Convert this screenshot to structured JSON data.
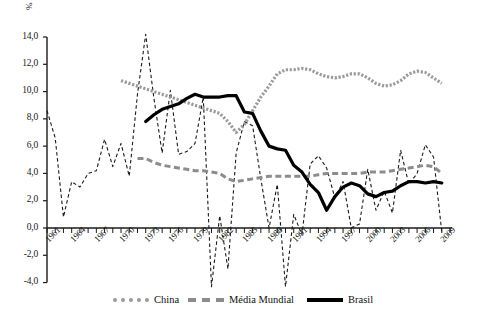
{
  "chart_data": {
    "type": "line",
    "title": "",
    "xlabel": "",
    "ylabel": "%",
    "ylim": [
      -4.0,
      14.0
    ],
    "ytick_labels": [
      "14,0",
      "12,0",
      "10,0",
      "8,0",
      "6,0",
      "4,0",
      "2,0",
      "0,0",
      "-2,0",
      "-4,0"
    ],
    "ytick_values": [
      14.0,
      12.0,
      10.0,
      8.0,
      6.0,
      4.0,
      2.0,
      0.0,
      -2.0,
      -4.0
    ],
    "xlim": [
      1961,
      2010
    ],
    "xtick_labels": [
      "1961",
      "1964",
      "1967",
      "1970",
      "1973",
      "1976",
      "1979",
      "1982",
      "1985",
      "1988",
      "1991",
      "1994",
      "1997",
      "2000",
      "2003",
      "2006",
      "2009"
    ],
    "xtick_values": [
      1961,
      1964,
      1967,
      1970,
      1973,
      1976,
      1979,
      1982,
      1985,
      1988,
      1991,
      1994,
      1997,
      2000,
      2003,
      2006,
      2009
    ],
    "grid": false,
    "legend_position": "bottom",
    "series": [
      {
        "name": "Brasil (anual)",
        "in_legend": false,
        "style": "thin-dashed",
        "color": "#1a1a1a",
        "x": [
          1961,
          1962,
          1963,
          1964,
          1965,
          1966,
          1967,
          1968,
          1969,
          1970,
          1971,
          1972,
          1973,
          1974,
          1975,
          1976,
          1977,
          1978,
          1979,
          1980,
          1981,
          1982,
          1983,
          1984,
          1985,
          1986,
          1987,
          1988,
          1989,
          1990,
          1991,
          1992,
          1993,
          1994,
          1995,
          1996,
          1997,
          1998,
          1999,
          2000,
          2001,
          2002,
          2003,
          2004,
          2005,
          2006,
          2007,
          2008,
          2009
        ],
        "y": [
          8.6,
          6.6,
          0.8,
          3.4,
          3.0,
          4.0,
          4.2,
          6.5,
          4.5,
          6.2,
          3.8,
          9.8,
          14.2,
          9.5,
          5.5,
          10.1,
          5.4,
          5.6,
          6.2,
          9.6,
          -4.3,
          0.9,
          -3.0,
          5.5,
          7.8,
          7.5,
          3.6,
          0.0,
          3.2,
          -4.3,
          1.0,
          -0.5,
          4.7,
          5.3,
          4.4,
          2.2,
          3.4,
          0.0,
          0.3,
          4.3,
          1.3,
          2.7,
          1.1,
          5.7,
          3.2,
          4.0,
          6.1,
          5.2,
          -0.3
        ]
      },
      {
        "name": "China",
        "in_legend": true,
        "style": "thick-dotted",
        "color": "#9a9a9a",
        "x": [
          1970,
          1971,
          1972,
          1973,
          1974,
          1975,
          1976,
          1977,
          1978,
          1979,
          1980,
          1981,
          1982,
          1983,
          1984,
          1985,
          1986,
          1987,
          1988,
          1989,
          1990,
          1991,
          1992,
          1993,
          1994,
          1995,
          1996,
          1997,
          1998,
          1999,
          2000,
          2001,
          2002,
          2003,
          2004,
          2005,
          2006,
          2007,
          2008,
          2009
        ],
        "y": [
          10.8,
          10.6,
          10.4,
          10.2,
          10.0,
          9.8,
          9.6,
          9.4,
          9.2,
          9.0,
          8.8,
          8.6,
          8.4,
          7.8,
          7.0,
          7.6,
          8.6,
          9.6,
          10.4,
          11.3,
          11.6,
          11.6,
          11.7,
          11.6,
          11.3,
          11.1,
          11.0,
          11.1,
          11.3,
          11.3,
          11.0,
          10.6,
          10.4,
          10.5,
          10.8,
          11.3,
          11.5,
          11.4,
          11.0,
          10.6
        ]
      },
      {
        "name": "Média Mundial",
        "in_legend": true,
        "style": "dashed",
        "color": "#8c8c8c",
        "x": [
          1972,
          1973,
          1974,
          1975,
          1976,
          1977,
          1978,
          1979,
          1980,
          1981,
          1982,
          1983,
          1984,
          1985,
          1986,
          1987,
          1988,
          1989,
          1990,
          1991,
          1992,
          1993,
          1994,
          1995,
          1996,
          1997,
          1998,
          1999,
          2000,
          2001,
          2002,
          2003,
          2004,
          2005,
          2006,
          2007,
          2008,
          2009
        ],
        "y": [
          5.1,
          5.1,
          4.8,
          4.6,
          4.5,
          4.4,
          4.3,
          4.2,
          4.2,
          4.1,
          4.0,
          3.6,
          3.4,
          3.5,
          3.6,
          3.7,
          3.8,
          3.8,
          3.8,
          3.8,
          3.8,
          3.8,
          3.9,
          4.0,
          4.0,
          4.0,
          4.0,
          4.0,
          4.1,
          4.1,
          4.1,
          4.2,
          4.3,
          4.4,
          4.5,
          4.6,
          4.5,
          4.0
        ]
      },
      {
        "name": "Brasil",
        "in_legend": true,
        "style": "thick-solid",
        "color": "#000000",
        "x": [
          1973,
          1974,
          1975,
          1976,
          1977,
          1978,
          1979,
          1980,
          1981,
          1982,
          1983,
          1984,
          1985,
          1986,
          1987,
          1988,
          1989,
          1990,
          1991,
          1992,
          1993,
          1994,
          1995,
          1996,
          1997,
          1998,
          1999,
          2000,
          2001,
          2002,
          2003,
          2004,
          2005,
          2006,
          2007,
          2008,
          2009
        ],
        "y": [
          7.8,
          8.3,
          8.7,
          8.9,
          9.1,
          9.5,
          9.8,
          9.6,
          9.6,
          9.6,
          9.7,
          9.7,
          8.5,
          8.4,
          7.1,
          6.0,
          5.8,
          5.7,
          4.6,
          4.1,
          3.2,
          2.6,
          1.3,
          2.3,
          3.0,
          3.3,
          3.1,
          2.5,
          2.3,
          2.6,
          2.7,
          3.1,
          3.4,
          3.4,
          3.3,
          3.4,
          3.3
        ]
      }
    ],
    "legend_entries": [
      {
        "label": "China",
        "style": "thick-dotted",
        "color": "#9a9a9a"
      },
      {
        "label": "Média Mundial",
        "style": "dashed",
        "color": "#8c8c8c"
      },
      {
        "label": "Brasil",
        "style": "thick-solid",
        "color": "#000000"
      }
    ]
  },
  "axis": {
    "unit_label": "%"
  }
}
